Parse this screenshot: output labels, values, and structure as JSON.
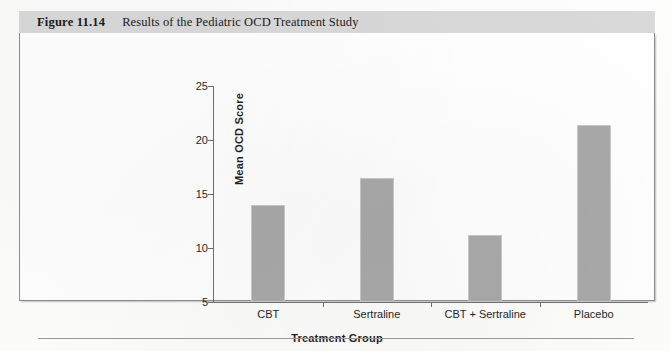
{
  "figure": {
    "number_label": "Figure 11.14",
    "caption": "Results of the Pediatric OCD Treatment Study"
  },
  "chart_data": {
    "type": "bar",
    "title": "Results of the Pediatric OCD Treatment Study",
    "categories": [
      "CBT",
      "Sertraline",
      "CBT + Sertraline",
      "Placebo"
    ],
    "values": [
      14.0,
      16.5,
      11.2,
      21.4
    ],
    "xlabel": "Treatment Group",
    "ylabel": "Mean OCD Score",
    "ylim": [
      5,
      25
    ],
    "yticks": [
      "5",
      "10",
      "15",
      "20",
      "25"
    ],
    "ytick_values": [
      5,
      10,
      15,
      20,
      25
    ],
    "grid": false,
    "legend": false,
    "bar_color": "#a9a9a9",
    "bar_edge_color": "#c9c9c9",
    "axis_color": "#6f6f6f",
    "plot_background": "#ffffff",
    "caption_band_color": "#d9d9d9"
  }
}
